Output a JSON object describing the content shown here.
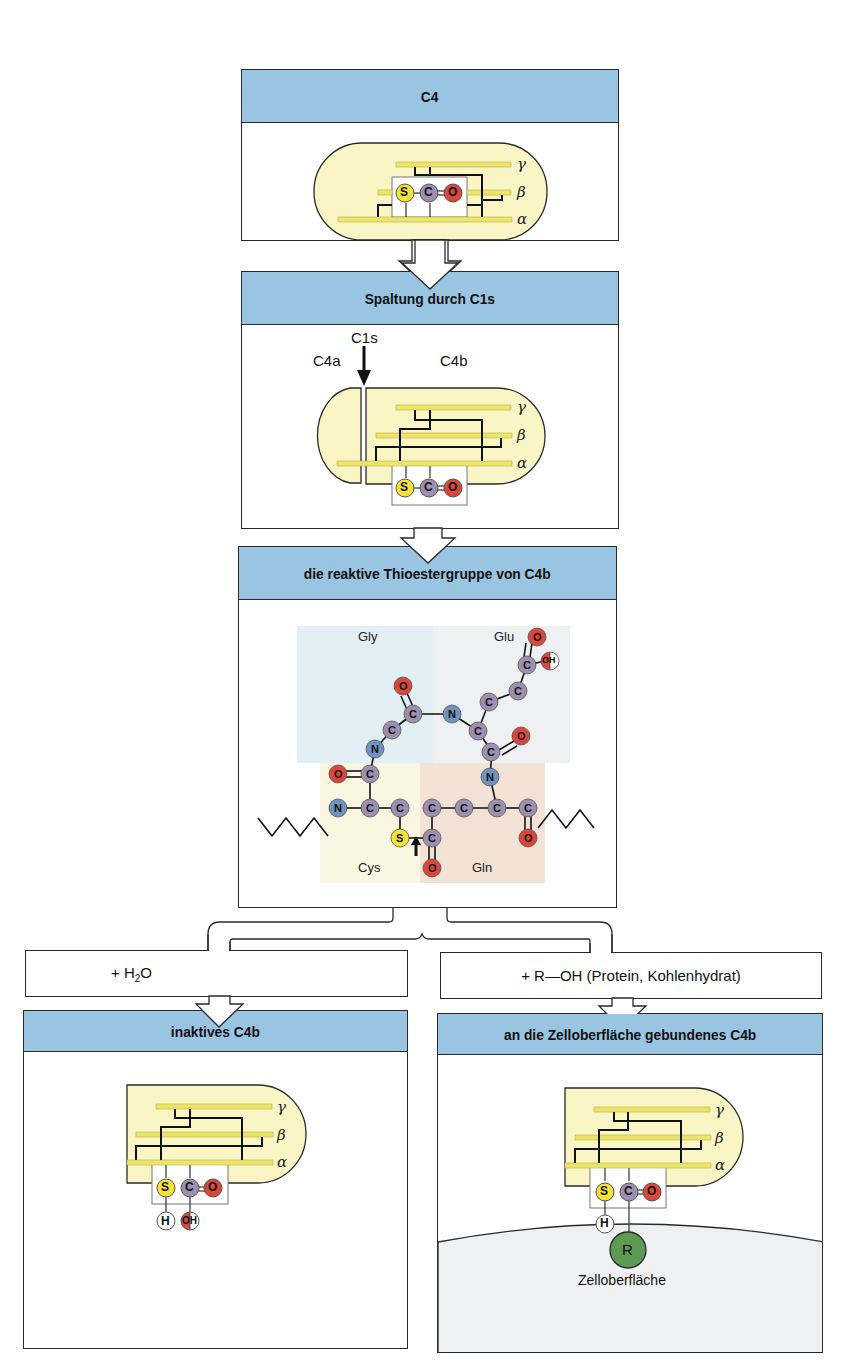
{
  "panels": {
    "c4": {
      "title": "C4"
    },
    "cleavage": {
      "title": "Spaltung durch C1s",
      "label_c1s": "C1s",
      "label_c4a": "C4a",
      "label_c4b": "C4b"
    },
    "thioester": {
      "title": "die reaktive Thioestergruppe von C4b",
      "residues": {
        "gly": "Gly",
        "glu": "Glu",
        "cys": "Cys",
        "gln": "Gln"
      }
    },
    "inactive": {
      "title": "inaktives C4b"
    },
    "bound": {
      "title": "an die Zelloberfläche gebundenes C4b",
      "surface_label": "Zelloberfläche",
      "r_label": "R"
    }
  },
  "reactions": {
    "water": {
      "prefix": "+ H",
      "sub": "2",
      "suffix": "O"
    },
    "roh": {
      "label": "+ R—OH (Protein, Kohlenhydrat)"
    }
  },
  "chains": {
    "gamma": "γ",
    "beta": "β",
    "alpha": "α"
  },
  "atoms": {
    "S": "S",
    "C": "C",
    "O": "O",
    "N": "N",
    "H": "H",
    "OH": "OH"
  },
  "colors": {
    "header_blue": "#9ac5e2",
    "capsule_fill": "#faf5c4",
    "chain_yellow": "#ede56a",
    "sulfur": "#f2e23a",
    "carbon": "#9d8fb0",
    "oxygen": "#d9473a",
    "nitrogen": "#6e93bf",
    "r_group": "#5d9b55",
    "gly_bg": "#e2eff4",
    "glu_bg": "#eef0f2",
    "cys_bg": "#fbf6e2",
    "gln_bg": "#f3e2d6",
    "surface": "#eef0f1"
  }
}
